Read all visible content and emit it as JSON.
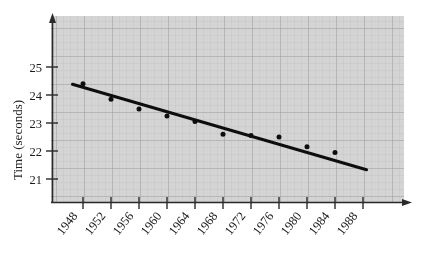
{
  "chart_data": {
    "type": "scatter",
    "title": "",
    "subtitle": "",
    "xlabel": "",
    "ylabel": "Time (seconds)",
    "xlim": [
      1946,
      1990
    ],
    "ylim": [
      20.5,
      25.9
    ],
    "grid": true,
    "legend": "none",
    "xtick_labels": [
      "1948",
      "1952",
      "1956",
      "1960",
      "1964",
      "1968",
      "1972",
      "1976",
      "1980",
      "1984",
      "1988"
    ],
    "xtick_values": [
      1948,
      1952,
      1956,
      1960,
      1964,
      1968,
      1972,
      1976,
      1980,
      1984,
      1988
    ],
    "ytick_labels": [
      "21",
      "22",
      "23",
      "24",
      "25"
    ],
    "ytick_values": [
      21,
      22,
      23,
      24,
      25
    ],
    "x": [
      1948,
      1952,
      1956,
      1960,
      1964,
      1968,
      1972,
      1976,
      1980,
      1984
    ],
    "values": [
      24.4,
      23.85,
      23.5,
      23.25,
      23.05,
      22.6,
      22.55,
      22.5,
      22.15,
      21.95
    ],
    "series": [
      {
        "name": "Winning time",
        "type": "scatter",
        "x": [
          1948,
          1952,
          1956,
          1960,
          1964,
          1968,
          1972,
          1976,
          1980,
          1984
        ],
        "values": [
          24.4,
          23.85,
          23.5,
          23.25,
          23.05,
          22.6,
          22.55,
          22.5,
          22.15,
          21.95
        ],
        "marker": "filled-circle",
        "color": "#111111"
      },
      {
        "name": "Fitted trend line",
        "type": "line",
        "x": [
          1946.5,
          1988.5
        ],
        "values": [
          24.38,
          21.33
        ],
        "color": "#111111"
      }
    ],
    "annotations": []
  },
  "figure": {
    "background_color": "#d2d2d2",
    "grid_minor_color": "#bcbcbc",
    "grid_major_color": "#9c9c9c",
    "axis_color": "#222222",
    "ink_color": "#111111",
    "y_axis_label": "Time (seconds)",
    "x_axis_arrow": "arrow-right",
    "y_axis_arrow": "arrow-up"
  }
}
